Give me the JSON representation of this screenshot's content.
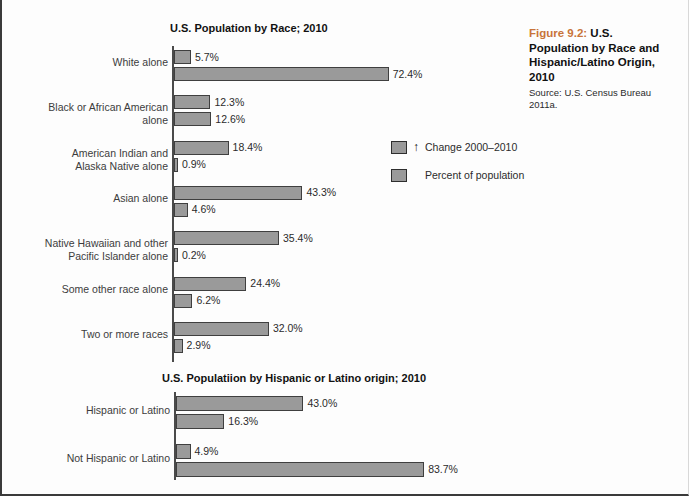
{
  "caption": {
    "figure_number": "Figure 9.2:",
    "title_line1": "U.S.",
    "title_line2": "Population by Race and",
    "title_line3": "Hispanic/Latino Origin,",
    "title_line4": "2010",
    "source": "Source: U.S. Census Bureau 2011a."
  },
  "legend": {
    "arrow_glyph": "↑",
    "items": [
      {
        "label": "Change 2000–2010",
        "color": "#9a9a9a",
        "has_arrow": true
      },
      {
        "label": "Percent of population",
        "color": "#9a9a9a",
        "has_arrow": false
      }
    ]
  },
  "chart_data": [
    {
      "type": "bar",
      "orientation": "horizontal",
      "title": "U.S. Population by Race; 2010",
      "xlabel": "",
      "ylabel": "",
      "xlim": [
        0,
        90
      ],
      "grid": false,
      "legend_position": "center",
      "categories": [
        "White alone",
        "Black or African American\nalone",
        "American Indian and\nAlaska Native alone",
        "Asian alone",
        "Native Hawaiian and other\nPacific Islander alone",
        "Some other race alone",
        "Two or more races"
      ],
      "series": [
        {
          "name": "Change 2000–2010",
          "values": [
            5.7,
            12.3,
            18.4,
            43.3,
            35.4,
            24.4,
            32.0
          ],
          "labels": [
            "5.7%",
            "12.3%",
            "18.4%",
            "43.3%",
            "35.4%",
            "24.4%",
            "32.0%"
          ]
        },
        {
          "name": "Percent of population",
          "values": [
            72.4,
            12.6,
            0.9,
            4.6,
            0.2,
            6.2,
            2.9
          ],
          "labels": [
            "72.4%",
            "12.6%",
            "0.9%",
            "4.6%",
            "0.2%",
            "6.2%",
            "2.9%"
          ]
        }
      ]
    },
    {
      "type": "bar",
      "orientation": "horizontal",
      "title": "U.S. Populatiion by Hispanic or Latino origin; 2010",
      "xlabel": "",
      "ylabel": "",
      "xlim": [
        0,
        90
      ],
      "grid": false,
      "legend_position": "none",
      "categories": [
        "Hispanic or Latino",
        "Not Hispanic or Latino"
      ],
      "series": [
        {
          "name": "Change 2000–2010",
          "values": [
            43.0,
            4.9
          ],
          "labels": [
            "43.0%",
            "4.9%"
          ]
        },
        {
          "name": "Percent of population",
          "values": [
            16.3,
            83.7
          ],
          "labels": [
            "16.3%",
            "83.7%"
          ]
        }
      ]
    }
  ]
}
